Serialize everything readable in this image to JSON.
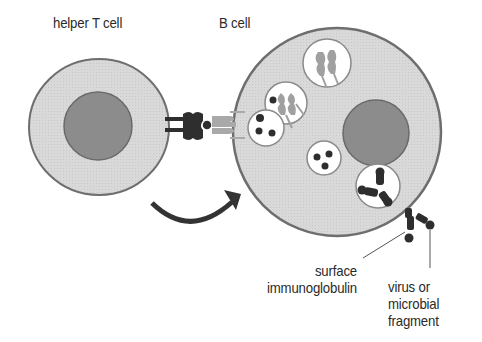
{
  "diagram": {
    "labels": {
      "helper_t_cell": "helper T cell",
      "b_cell": "B cell",
      "surface_immunoglobulin_line1": "surface",
      "surface_immunoglobulin_line2": "immunoglobulin",
      "virus_line1": "virus or",
      "virus_line2": "microbial",
      "virus_line3": "fragment"
    },
    "colors": {
      "cytoplasm": "#d6d6d6",
      "membrane": "#707070",
      "nucleus": "#8f8f8f",
      "dark_molecule": "#2e2e2e",
      "light_molecule": "#a9a9a9",
      "vesicle": "#ffffff",
      "arrow": "#333333"
    }
  }
}
